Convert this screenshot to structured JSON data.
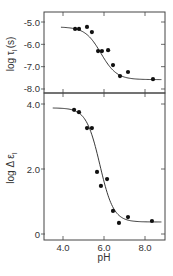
{
  "chart_data": [
    {
      "type": "scatter",
      "panel": "top",
      "title": "",
      "xlabel": "pH",
      "ylabel": "log τ_I (s)",
      "ylabel_main": "log τ",
      "ylabel_sub": "I",
      "ylabel_unit": "(s)",
      "xlim": [
        3.07,
        8.98
      ],
      "ylim": [
        -8.2,
        -4.55
      ],
      "x_ticks": [
        4.0,
        6.0,
        8.0
      ],
      "y_ticks": [
        -5.0,
        -6.0,
        -7.0,
        -8.0
      ],
      "y_tick_labels": [
        "-5.0",
        "-6.0",
        "-7.0",
        "-8.0"
      ],
      "grid": false,
      "series": [
        {
          "name": "measured",
          "x": [
            4.59,
            4.78,
            5.17,
            5.41,
            5.71,
            5.9,
            6.2,
            6.44,
            6.78,
            7.17,
            8.39
          ],
          "y": [
            -5.31,
            -5.31,
            -5.22,
            -5.45,
            -6.3,
            -6.3,
            -6.26,
            -6.93,
            -7.42,
            -7.24,
            -7.56
          ]
        }
      ],
      "fit_curve": {
        "model": "sigmoid",
        "high": -5.22,
        "low": -7.58,
        "midpoint_pH": 5.85,
        "slope": 2.6,
        "x_range": [
          3.9,
          8.8
        ]
      }
    },
    {
      "type": "scatter",
      "panel": "bottom",
      "title": "",
      "xlabel": "pH",
      "ylabel": "log Δε_I",
      "ylabel_main": "log Δ ε",
      "ylabel_sub": "I",
      "xlim": [
        3.07,
        8.98
      ],
      "ylim": [
        -0.2,
        4.35
      ],
      "x_ticks": [
        4.0,
        6.0,
        8.0
      ],
      "x_tick_labels": [
        "4.0",
        "6.0",
        "8.0"
      ],
      "y_ticks": [
        4.0,
        2.0,
        0
      ],
      "y_tick_labels": [
        "4.0",
        "2.0",
        "0"
      ],
      "grid": false,
      "series": [
        {
          "name": "measured",
          "x": [
            4.54,
            4.78,
            5.17,
            5.41,
            5.66,
            5.85,
            6.15,
            6.44,
            6.73,
            7.17,
            8.34
          ],
          "y": [
            3.82,
            3.75,
            3.26,
            3.26,
            1.91,
            1.48,
            1.69,
            0.71,
            0.34,
            0.52,
            0.4
          ]
        }
      ],
      "fit_curve": {
        "model": "sigmoid",
        "high": 3.88,
        "low": 0.37,
        "midpoint_pH": 5.8,
        "slope": 3.0,
        "x_range": [
          3.5,
          8.8
        ]
      }
    }
  ],
  "labels": {
    "x_axis": "pH",
    "top_y_axis": "log τ",
    "top_y_sub": "I",
    "top_y_unit": "(s)",
    "bottom_y_axis": "log Δ ε",
    "bottom_y_sub": "I"
  }
}
